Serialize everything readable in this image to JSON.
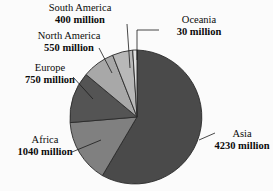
{
  "chart_data": {
    "type": "pie",
    "title": "",
    "subtitle": "",
    "xlabel": "",
    "ylabel": "",
    "units": "million",
    "total": 7000,
    "legend": "none",
    "grid": false,
    "start_angle_deg": 0,
    "direction": "counterclockwise",
    "categories": [
      "Asia",
      "Africa",
      "Europe",
      "North America",
      "South America",
      "Oceania"
    ],
    "values": [
      4230,
      1040,
      750,
      550,
      400,
      30
    ],
    "slices": [
      {
        "label": "Asia",
        "value": 4230,
        "value_text": "4230 million",
        "percent": 60.4,
        "color": "#4a4a4a",
        "path": "M 137 50 A 67 67 0 1 1 102.4 175.6 L 137 117 Z",
        "leader": "M 199 140 L 215 133"
      },
      {
        "label": "Africa",
        "value": 1040,
        "value_text": "1040 million",
        "percent": 14.9,
        "color": "#808080",
        "path": "M 102.4 175.6 A 67 67 0 0 1 70.1 122.6 L 137 117 Z",
        "leader": "M 101 140 L 72 152"
      },
      {
        "label": "Europe",
        "value": 750,
        "value_text": "750 million",
        "percent": 10.7,
        "color": "#545454",
        "path": "M 70.1 122.6 A 67 67 0 0 1 86.0 74.5 L 137 117 Z",
        "leader": "M 93 99 L 73 77"
      },
      {
        "label": "North America",
        "value": 550,
        "value_text": "550 million",
        "percent": 7.9,
        "color": "#a8a8a8",
        "path": "M 86.0 74.5 A 67 67 0 0 1 112.7 55.2 L 137 117 Z",
        "leader": "M 112 73 L 99 48"
      },
      {
        "label": "South America",
        "value": 400,
        "value_text": "400 million",
        "percent": 5.7,
        "color": "#b8b8b8",
        "path": "M 112.7 55.2 A 67 67 0 0 1 132.7 50.1 L 137 117 Z",
        "leader": "M 130 68 L 127 24"
      },
      {
        "label": "Oceania",
        "value": 30,
        "value_text": "30 million",
        "percent": 0.4,
        "color": "#e0e0e0",
        "path": "M 132.7 50.1 A 67 67 0 0 1 137 50 L 137 117 Z",
        "leader": "M 137 60 L 137 30 L 159 30"
      }
    ],
    "background_color": "#fbfbfb",
    "outline_color": "#2a2a2a",
    "leader_color": "#1a1a1a"
  },
  "labels": {
    "south_america": {
      "region": "South America",
      "value": "400 million"
    },
    "north_america": {
      "region": "North America",
      "value": "550 million"
    },
    "europe": {
      "region": "Europe",
      "value": "750 million"
    },
    "africa": {
      "region": "Africa",
      "value": "1040 million"
    },
    "oceania": {
      "region": "Oceania",
      "value": "30 million"
    },
    "asia": {
      "region": "Asia",
      "value": "4230 million"
    }
  }
}
